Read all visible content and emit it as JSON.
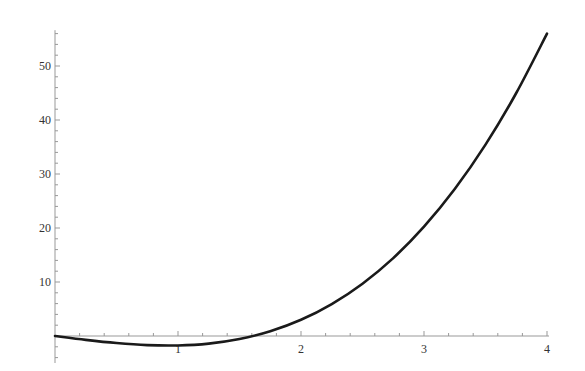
{
  "chart_data": {
    "type": "line",
    "title": "",
    "xlabel": "",
    "ylabel": "",
    "xlim": [
      0,
      4
    ],
    "ylim": [
      -5,
      57
    ],
    "grid": false,
    "legend": null,
    "x_ticks": [
      1,
      2,
      3,
      4
    ],
    "x_tick_labels": [
      "1",
      "2",
      "3",
      "4"
    ],
    "y_ticks": [
      10,
      20,
      30,
      40,
      50
    ],
    "y_tick_labels": [
      "10",
      "20",
      "30",
      "40",
      "50"
    ],
    "series": [
      {
        "name": "f(x)",
        "color": "#1a1a1a",
        "x": [
          0,
          0.25,
          0.5,
          0.75,
          1,
          1.25,
          1.5,
          1.75,
          2,
          2.25,
          2.5,
          2.75,
          3,
          3.25,
          3.5,
          3.75,
          4
        ],
        "y": [
          0,
          -0.72,
          -1.31,
          -1.69,
          -1.75,
          -1.41,
          -0.56,
          0.88,
          3.0,
          5.92,
          9.69,
          14.42,
          20.25,
          27.22,
          35.44,
          45.0,
          56.0
        ]
      }
    ]
  },
  "colors": {
    "axis": "#999999",
    "curve": "#1a1a1a",
    "label": "#333333"
  }
}
